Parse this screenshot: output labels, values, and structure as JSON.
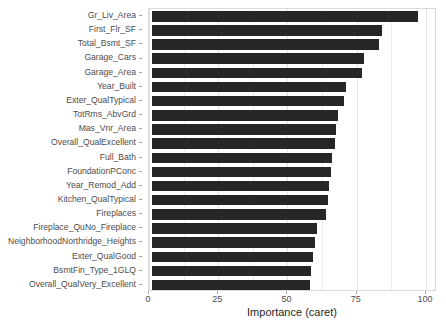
{
  "chart_data": {
    "type": "bar",
    "orientation": "horizontal",
    "title": "",
    "subtitle": "",
    "xlabel": "Importance (caret)",
    "ylabel": "",
    "xlim": [
      0,
      104
    ],
    "xticks": [
      0,
      25,
      50,
      75,
      100
    ],
    "xticklabels": [
      "0",
      "25",
      "50",
      "75",
      "100"
    ],
    "grid": true,
    "legend": null,
    "bar_color": "#262626",
    "panel_background": "#ffffff",
    "gridline_color": "#ebebeb",
    "categories": [
      "Gr_Liv_Area",
      "First_Flr_SF",
      "Total_Bsmt_SF",
      "Garage_Cars",
      "Garage_Area",
      "Year_Built",
      "Exter_QualTypical",
      "TotRms_AbvGrd",
      "Mas_Vnr_Area",
      "Overall_QualExcellent",
      "Full_Bath",
      "FoundationPConc",
      "Year_Remod_Add",
      "Kitchen_QualTypical",
      "Fireplaces",
      "Fireplace_QuNo_Fireplace",
      "NeighborhoodNorthridge_Heights",
      "Exter_QualGood",
      "BsmtFin_Type_1GLQ",
      "Overall_QualVery_Excellent"
    ],
    "values": [
      96.0,
      83.0,
      82.0,
      76.5,
      76.0,
      70.0,
      69.5,
      67.0,
      66.5,
      66.0,
      65.0,
      64.5,
      64.0,
      63.5,
      63.0,
      59.5,
      59.0,
      58.0,
      57.5,
      57.0
    ]
  }
}
